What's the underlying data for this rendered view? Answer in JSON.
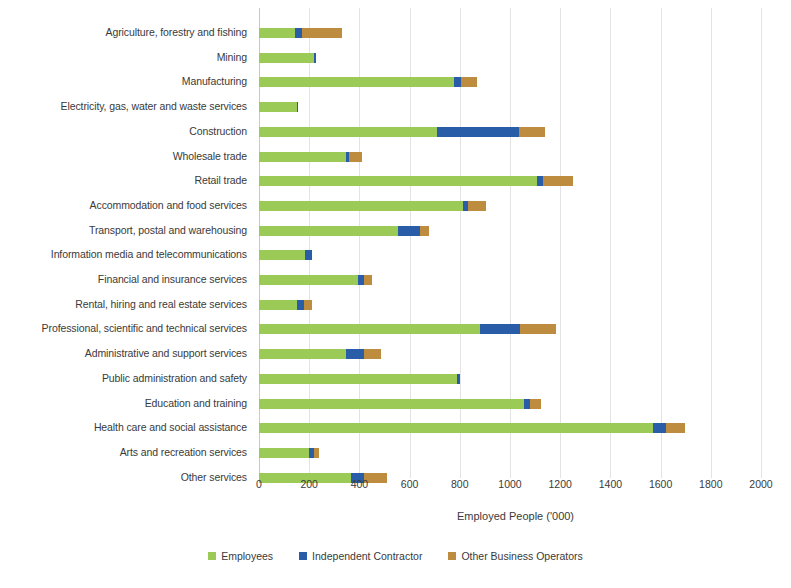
{
  "chart_data": {
    "type": "bar",
    "orientation": "horizontal",
    "stacked": true,
    "title": "",
    "xlabel": "Employed People ('000)",
    "ylabel": "",
    "xlim": [
      0,
      2000
    ],
    "xticks": [
      0,
      200,
      400,
      600,
      800,
      1000,
      1200,
      1400,
      1600,
      1800,
      2000
    ],
    "xtick_labels": [
      "0",
      "200",
      "400",
      "600",
      "800",
      "1000",
      "1200",
      "1400",
      "1600",
      "1800",
      "2000"
    ],
    "grid": true,
    "grid_axis": "x",
    "legend_position": "bottom",
    "categories": [
      "Agriculture, forestry and fishing",
      "Mining",
      "Manufacturing",
      "Electricity, gas, water and waste services",
      "Construction",
      "Wholesale trade",
      "Retail trade",
      "Accommodation and food services",
      "Transport, postal and warehousing",
      "Information media and telecommunications",
      "Financial and insurance services",
      "Rental, hiring and real estate services",
      "Professional, scientific and technical services",
      "Administrative and support services",
      "Public administration and safety",
      "Education and training",
      "Health care and social assistance",
      "Arts and recreation services",
      "Other services"
    ],
    "series": [
      {
        "name": "Employees",
        "color": "#9bca56",
        "values": [
          145,
          220,
          775,
          150,
          710,
          345,
          1106,
          814,
          555,
          185,
          395,
          150,
          880,
          345,
          790,
          1055,
          1568,
          200,
          365
        ]
      },
      {
        "name": "Independent Contractor",
        "color": "#2a5da8",
        "values": [
          27,
          8,
          30,
          6,
          325,
          15,
          24,
          20,
          85,
          25,
          25,
          30,
          160,
          75,
          10,
          25,
          52,
          20,
          55
        ]
      },
      {
        "name": "Other Business Operators",
        "color": "#bd8c3f",
        "values": [
          160,
          0,
          65,
          0,
          105,
          50,
          120,
          70,
          38,
          0,
          30,
          30,
          145,
          65,
          0,
          45,
          77,
          20,
          90
        ]
      }
    ],
    "totals": [
      332,
      228,
      870,
      156,
      1140,
      410,
      1250,
      904,
      678,
      210,
      450,
      210,
      1185,
      485,
      800,
      1125,
      1697,
      240,
      510
    ]
  },
  "axis": {
    "x_title": "Employed People ('000)"
  },
  "legend": {
    "items": [
      {
        "label": "Employees",
        "color": "#9bca56"
      },
      {
        "label": "Independent Contractor",
        "color": "#2a5da8"
      },
      {
        "label": "Other Business Operators",
        "color": "#bd8c3f"
      }
    ]
  }
}
